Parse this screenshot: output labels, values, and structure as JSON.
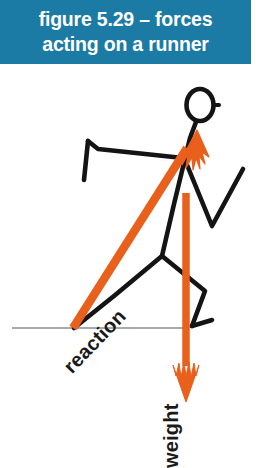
{
  "figure": {
    "caption": {
      "line1": "figure 5.29 – forces",
      "line2": "acting on a runner",
      "full_text": "figure 5.29 – forces acting on a runner",
      "figure_number": "5.29",
      "background_color": "#1b7ba5",
      "text_color": "#ffffff"
    },
    "labels": {
      "reaction": "reaction",
      "weight": "weight"
    },
    "colors": {
      "vector_orange": "#e8601c",
      "stick_figure_black": "#111111",
      "ground_line": "#4a4a4a",
      "background": "#ffffff"
    },
    "diagram": {
      "type": "free-body-diagram",
      "subject": "runner",
      "vectors": [
        {
          "name": "reaction",
          "label": "reaction",
          "color": "#e8601c",
          "direction": "up-and-forward",
          "origin": "foot contact with ground",
          "tail": [
            73,
            328
          ],
          "head": [
            196,
            134
          ]
        },
        {
          "name": "weight",
          "label": "weight",
          "color": "#e8601c",
          "direction": "straight-down",
          "origin": "centre of mass",
          "tail": [
            186,
            193
          ],
          "head": [
            186,
            400
          ]
        }
      ],
      "ground_line": {
        "name": "ground",
        "y": 328,
        "x_start": 12,
        "x_end": 186
      }
    }
  }
}
